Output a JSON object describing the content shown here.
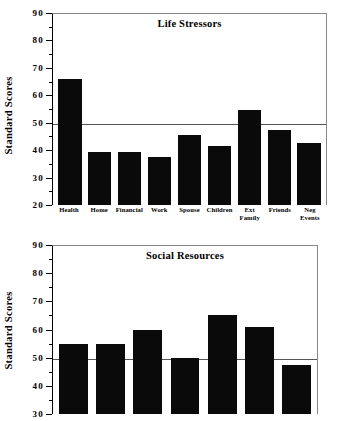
{
  "chart_data": [
    {
      "type": "bar",
      "title": "Life  Stressors",
      "xlabel": "",
      "ylabel": "Standard Scores",
      "ylim": [
        20,
        90
      ],
      "ytick_major": [
        90,
        80,
        70,
        60,
        50,
        40,
        30,
        20
      ],
      "ytick_minor": [
        85,
        75,
        65,
        55,
        45,
        35,
        25
      ],
      "grid": false,
      "reference_line": 50,
      "legend": "none",
      "categories": [
        "Health",
        "Home",
        "Financial",
        "Work",
        "Spouse",
        "Children",
        "Ext Family",
        "Friends",
        "Neg Events"
      ],
      "category_lines": [
        [
          "Health"
        ],
        [
          "Home"
        ],
        [
          "Financial"
        ],
        [
          "Work"
        ],
        [
          "Spouse"
        ],
        [
          "Children"
        ],
        [
          "Ext",
          "Family"
        ],
        [
          "Friends"
        ],
        [
          "Neg",
          "Events"
        ]
      ],
      "values": [
        66,
        39.5,
        39.5,
        37.5,
        45.5,
        41.5,
        54.5,
        47.5,
        42.5
      ],
      "bar_color": "#0a0a0a"
    },
    {
      "type": "bar",
      "title": "Social  Resources",
      "xlabel": "",
      "ylabel": "Standard Scores",
      "ylim": [
        30,
        90
      ],
      "ytick_major": [
        90,
        80,
        70,
        60,
        50,
        40,
        30
      ],
      "ytick_minor": [
        85,
        75,
        65,
        55,
        45,
        35
      ],
      "grid": false,
      "reference_line": 50,
      "legend": "none",
      "categories": [
        "",
        "",
        "",
        "",
        "",
        "",
        ""
      ],
      "category_lines": [
        [],
        [],
        [],
        [],
        [],
        [],
        []
      ],
      "values": [
        55,
        55,
        60,
        50,
        65,
        61,
        47.5
      ],
      "bar_color": "#0a0a0a",
      "note": "bottom of chart cropped by screenshot edge"
    }
  ],
  "chart1": {
    "title": "Life  Stressors",
    "ylabel": "Standard Scores",
    "yticks": [
      "90",
      "80",
      "70",
      "60",
      "50",
      "40",
      "30",
      "20"
    ]
  },
  "chart2": {
    "title": "Social  Resources",
    "ylabel": "Standard Scores",
    "yticks": [
      "90",
      "80",
      "70",
      "60",
      "50",
      "40",
      "30"
    ]
  }
}
